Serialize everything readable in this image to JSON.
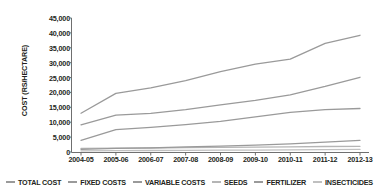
{
  "chart_data": {
    "type": "line",
    "title": "",
    "xlabel": "",
    "ylabel": "COST (RS/HECTARE)",
    "categories": [
      "2004-05",
      "2005-06",
      "2006-07",
      "2007-08",
      "2008-09",
      "2009-10",
      "2010-11",
      "2011-12",
      "2012-13"
    ],
    "ylim": [
      0,
      45000
    ],
    "ytick_step": 5000,
    "yticks": [
      "45,000",
      "40,000",
      "35,000",
      "30,000",
      "25,000",
      "20,000",
      "15,000",
      "10,000",
      "5,000",
      "0"
    ],
    "ytick_values": [
      45000,
      40000,
      35000,
      30000,
      25000,
      20000,
      15000,
      10000,
      5000,
      0
    ],
    "grid": false,
    "legend_position": "bottom",
    "series": [
      {
        "name": "TOTAL COST",
        "color": "#9a9a9a",
        "values": [
          13000,
          19700,
          21500,
          24000,
          27000,
          29500,
          31200,
          36500,
          39200
        ]
      },
      {
        "name": "FIXED COSTS",
        "color": "#9a9a9a",
        "values": [
          3900,
          7500,
          8300,
          9200,
          10300,
          11800,
          13300,
          14200,
          14600
        ]
      },
      {
        "name": "VARIABLE COSTS",
        "color": "#9a9a9a",
        "values": [
          9100,
          12400,
          13000,
          14200,
          15800,
          17300,
          19200,
          22000,
          25100
        ]
      },
      {
        "name": "SEEDS",
        "color": "#b5b5b5",
        "values": [
          1200,
          1300,
          1350,
          1450,
          1550,
          1650,
          1750,
          1850,
          1900
        ]
      },
      {
        "name": "FERTILIZER",
        "color": "#9a9a9a",
        "values": [
          900,
          1200,
          1400,
          1700,
          2000,
          2300,
          2700,
          3300,
          3900
        ]
      },
      {
        "name": "INSECTICIDES",
        "color": "#c0c0c0",
        "values": [
          400,
          450,
          500,
          550,
          600,
          650,
          700,
          780,
          850
        ]
      }
    ]
  },
  "axis": {
    "line_color": "#6f6f6f"
  }
}
